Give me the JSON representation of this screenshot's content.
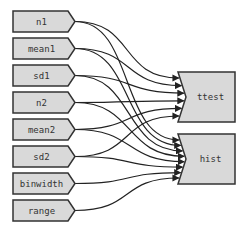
{
  "diagram": {
    "type": "dependency-graph",
    "colors": {
      "node_fill": "#d9d9d9",
      "node_stroke": "#333333",
      "edge": "#222222",
      "background": "#ffffff"
    },
    "inputs": [
      {
        "id": "n1",
        "label": "n1"
      },
      {
        "id": "mean1",
        "label": "mean1"
      },
      {
        "id": "sd1",
        "label": "sd1"
      },
      {
        "id": "n2",
        "label": "n2"
      },
      {
        "id": "mean2",
        "label": "mean2"
      },
      {
        "id": "sd2",
        "label": "sd2"
      },
      {
        "id": "binwidth",
        "label": "binwidth"
      },
      {
        "id": "range",
        "label": "range"
      }
    ],
    "outputs": [
      {
        "id": "ttest",
        "label": "ttest"
      },
      {
        "id": "hist",
        "label": "hist"
      }
    ],
    "edges": [
      {
        "from": "n1",
        "to": "ttest"
      },
      {
        "from": "n1",
        "to": "hist"
      },
      {
        "from": "mean1",
        "to": "ttest"
      },
      {
        "from": "mean1",
        "to": "hist"
      },
      {
        "from": "sd1",
        "to": "ttest"
      },
      {
        "from": "sd1",
        "to": "hist"
      },
      {
        "from": "n2",
        "to": "ttest"
      },
      {
        "from": "n2",
        "to": "hist"
      },
      {
        "from": "mean2",
        "to": "ttest"
      },
      {
        "from": "mean2",
        "to": "hist"
      },
      {
        "from": "sd2",
        "to": "ttest"
      },
      {
        "from": "sd2",
        "to": "hist"
      },
      {
        "from": "binwidth",
        "to": "hist"
      },
      {
        "from": "range",
        "to": "hist"
      }
    ]
  }
}
